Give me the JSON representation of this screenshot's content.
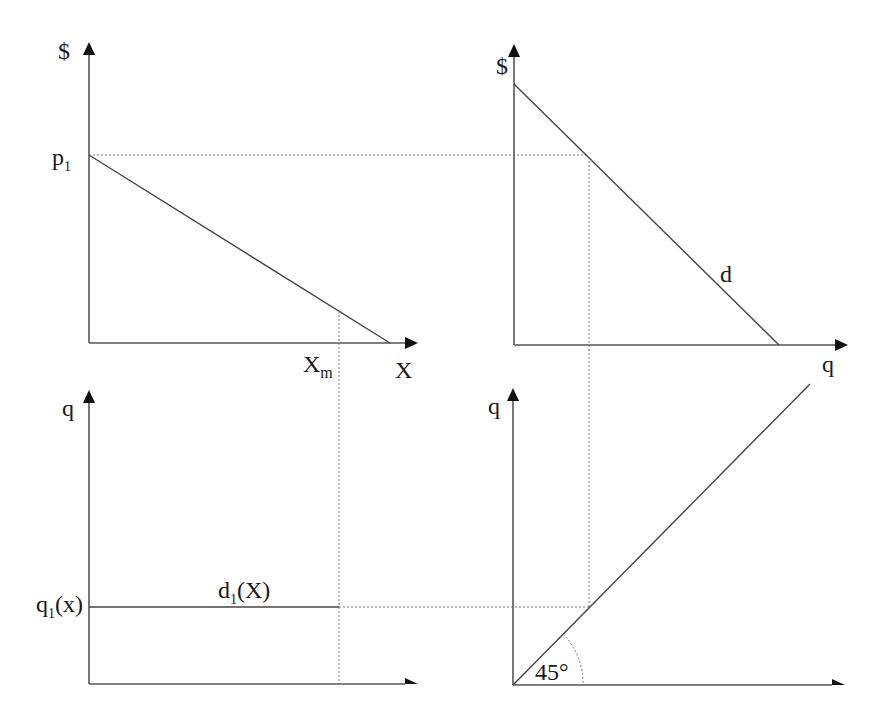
{
  "diagram": {
    "type": "four-quadrant economics diagram",
    "colors": {
      "axis": "#555555",
      "curve": "#444444",
      "guide": "#777777",
      "text": "#1a1a1a"
    },
    "panels": {
      "top_left": {
        "y_axis_label": "$",
        "x_axis_label": "X",
        "y_tick_label_main": "p",
        "y_tick_label_sub": "1",
        "x_tick_label_main": "X",
        "x_tick_label_sub": "m"
      },
      "top_right": {
        "y_axis_label": "$",
        "x_axis_label": "q",
        "curve_label": "d"
      },
      "bottom_left": {
        "y_axis_label": "q",
        "y_tick_label_main": "q",
        "y_tick_label_sub": "1",
        "y_tick_label_tail": "(x)",
        "curve_label_main": "d",
        "curve_label_sub": "1",
        "curve_label_tail": "(X)"
      },
      "bottom_right": {
        "y_axis_label": "q",
        "angle_label": "45°"
      }
    }
  }
}
